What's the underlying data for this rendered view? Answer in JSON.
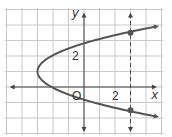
{
  "chart_data": {
    "type": "line",
    "title": "",
    "xlabel": "x",
    "ylabel": "y",
    "xlim": [
      -5,
      5
    ],
    "ylim": [
      -3,
      5
    ],
    "grid": true,
    "x_tick_labels": [
      {
        "value": 2,
        "label": "2"
      }
    ],
    "y_tick_labels": [
      {
        "value": 2,
        "label": "2"
      }
    ],
    "origin_label": "O",
    "series": [
      {
        "name": "parabola opening right",
        "vertex": [
          -3,
          1
        ],
        "equation": "x = (y - 1)^2 / 1.1 - 3",
        "y_range": [
          -1.9,
          3.9
        ],
        "arrows_at_ends": true
      }
    ],
    "reference_lines": [
      {
        "name": "dashed vertical line",
        "x": 3,
        "style": "dashed"
      }
    ],
    "points": [
      {
        "x": 3,
        "y": 3.5
      },
      {
        "x": 3,
        "y": -1.5
      }
    ]
  },
  "colors": {
    "grid": "#c8c8c8",
    "axis": "#444444",
    "curve": "#555555",
    "point": "#555555"
  }
}
